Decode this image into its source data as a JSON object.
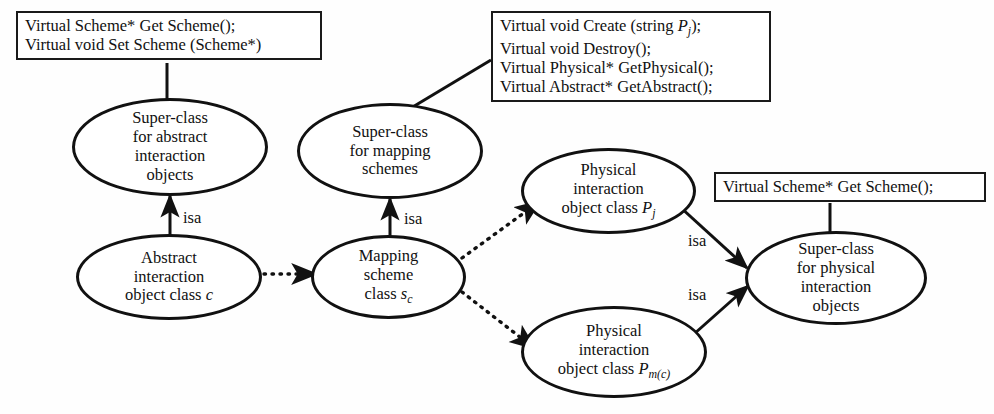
{
  "diagram": {
    "type": "uml-class-hierarchy",
    "colors": {
      "stroke": "#111111",
      "fill": "#ffffff",
      "background": "#fefefe",
      "text": "#111111"
    },
    "boxes": [
      {
        "id": "box-abstract-methods",
        "lines": [
          "Virtual Scheme* Get Scheme();",
          "Virtual void Set Scheme (Scheme*)"
        ]
      },
      {
        "id": "box-mapping-methods",
        "lines": [
          "Virtual void Create (string Pⱼ);",
          "Virtual void Destroy();",
          "Virtual Physical* GetPhysical();",
          "Virtual Abstract* GetAbstract();"
        ]
      },
      {
        "id": "box-physical-methods",
        "lines": [
          "Virtual Scheme* Get Scheme();"
        ]
      }
    ],
    "nodes": [
      {
        "id": "node-superclass-abstract",
        "lines": [
          "Super-class",
          "for abstract",
          "interaction",
          "objects"
        ]
      },
      {
        "id": "node-superclass-mapping",
        "lines": [
          "Super-class",
          "for mapping",
          "schemes"
        ]
      },
      {
        "id": "node-abstract-class",
        "lines": [
          "Abstract",
          "interaction",
          "object class c"
        ],
        "symbol": "c"
      },
      {
        "id": "node-mapping-class",
        "lines": [
          "Mapping",
          "scheme",
          "class s_c"
        ],
        "symbol": "s",
        "subscript": "c"
      },
      {
        "id": "node-physical-pj",
        "lines": [
          "Physical",
          "interaction",
          "object class P_j"
        ],
        "symbol": "P",
        "subscript": "j"
      },
      {
        "id": "node-physical-pmc",
        "lines": [
          "Physical",
          "interaction",
          "object class P_m(c)"
        ],
        "symbol": "P",
        "subscript": "m(c)"
      },
      {
        "id": "node-superclass-physical",
        "lines": [
          "Super-class",
          "for physical",
          "interaction",
          "objects"
        ]
      }
    ],
    "edges": [
      {
        "id": "edge-isa-abstract",
        "label": "isa",
        "style": "solid-arrow",
        "from": "node-abstract-class",
        "to": "node-superclass-abstract"
      },
      {
        "id": "edge-isa-mapping",
        "label": "isa",
        "style": "solid-arrow",
        "from": "node-mapping-class",
        "to": "node-superclass-mapping"
      },
      {
        "id": "edge-isa-physical-pj",
        "label": "isa",
        "style": "solid-arrow",
        "from": "node-physical-pj",
        "to": "node-superclass-physical"
      },
      {
        "id": "edge-isa-physical-pmc",
        "label": "isa",
        "style": "solid-arrow",
        "from": "node-physical-pmc",
        "to": "node-superclass-physical"
      },
      {
        "id": "edge-abstract-to-mapping",
        "label": "",
        "style": "dotted-arrow",
        "from": "node-abstract-class",
        "to": "node-mapping-class"
      },
      {
        "id": "edge-mapping-to-pj",
        "label": "",
        "style": "dotted-arrow",
        "from": "node-mapping-class",
        "to": "node-physical-pj"
      },
      {
        "id": "edge-mapping-to-pmc",
        "label": "",
        "style": "dotted-arrow",
        "from": "node-mapping-class",
        "to": "node-physical-pmc"
      },
      {
        "id": "edge-box-abstract",
        "label": "",
        "style": "solid-line",
        "from": "box-abstract-methods",
        "to": "node-superclass-abstract"
      },
      {
        "id": "edge-box-mapping",
        "label": "",
        "style": "solid-line",
        "from": "box-mapping-methods",
        "to": "node-superclass-mapping"
      },
      {
        "id": "edge-box-physical",
        "label": "",
        "style": "solid-line",
        "from": "box-physical-methods",
        "to": "node-superclass-physical"
      }
    ],
    "labels": {
      "isa_1": "isa",
      "isa_2": "isa",
      "isa_3": "isa",
      "isa_4": "isa"
    }
  }
}
